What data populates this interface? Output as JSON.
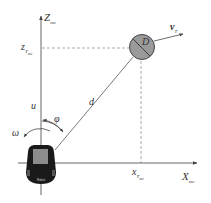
{
  "diagram": {
    "type": "coordinate-geometry",
    "axes": {
      "vertical": {
        "label": "Z",
        "subscript": "mc"
      },
      "horizontal": {
        "label": "X",
        "subscript": "mc"
      }
    },
    "target": {
      "label": "D",
      "velocity_label": "v",
      "velocity_subscript": "T",
      "z_coord_label": "z",
      "z_coord_subscript": "T",
      "z_coord_subsubscript": "mc",
      "x_coord_label": "x",
      "x_coord_subscript": "T",
      "x_coord_subsubscript": "mc",
      "fill_color": "#9a9a9a"
    },
    "robot": {
      "heading_label": "u",
      "angular_label": "ω",
      "angle_label": "φ",
      "distance_label": "d",
      "body_color": "#1a1a1a",
      "top_color": "#8c8c8c",
      "text": "Robot"
    },
    "colors": {
      "line": "#555555",
      "dash": "#888888"
    }
  }
}
